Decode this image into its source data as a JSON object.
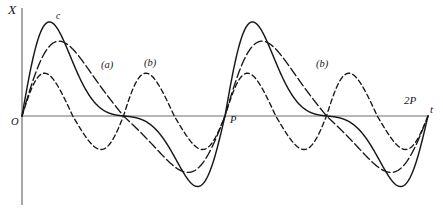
{
  "figure": {
    "kind": "line-plot",
    "background_color": "#ffffff",
    "axis_color": "#6e6e72",
    "curve_color": "#17171a"
  },
  "axes": {
    "y_axis_label": "X",
    "x_axis_label": "t",
    "origin_label": "O",
    "x_tick_labels": [
      "P",
      "2P"
    ],
    "y_axis_x_px": 22,
    "baseline_y_px": 116,
    "y_axis_top_px": 8,
    "y_axis_bottom_px": 205,
    "x_axis_left_px": 22,
    "x_axis_right_px": 428
  },
  "annotations": [
    {
      "id": "peak-c",
      "text": "c",
      "x_px": 56,
      "y_px": 12
    },
    {
      "id": "curve-a",
      "text": "(a)",
      "x_px": 101,
      "y_px": 60
    },
    {
      "id": "curve-b-1",
      "text": "(b)",
      "x_px": 144,
      "y_px": 58
    },
    {
      "id": "curve-b-2",
      "text": "(b)",
      "x_px": 316,
      "y_px": 59
    }
  ],
  "chart_data": {
    "type": "line",
    "title": "",
    "subtitle": "",
    "xlabel": "t",
    "ylabel": "X",
    "grid": false,
    "legend": "none",
    "xlim": [
      0,
      2
    ],
    "ylim": [
      -1.05,
      1.05
    ],
    "x_tick_values": [
      1,
      2
    ],
    "x_tick_labels": [
      "P",
      "2P"
    ],
    "y_tick_values": [],
    "y_tick_labels": [],
    "series": [
      {
        "name": "solid",
        "label": "c",
        "style": "solid",
        "amplitude_positive": 0.88,
        "amplitude_negative": -0.8,
        "cycles_per_period": 1,
        "skew": 0.62,
        "peak_x_px": 62,
        "peak_y_px": 28,
        "trough_x_px": 190,
        "trough_y_px": 195,
        "stroke_width": 1.45,
        "points_per_period": 1
      },
      {
        "name": "dash-dot",
        "label": "(a)",
        "style": "dash-dot",
        "amplitude_positive": 0.7,
        "amplitude_negative": -0.64,
        "cycles_per_period": 1,
        "skew": 0.3,
        "peak_x_px": 90,
        "peak_y_px": 45,
        "trough_x_px": 205,
        "trough_y_px": 180,
        "stroke_width": 1.35,
        "points_per_period": 1
      },
      {
        "name": "dashed",
        "label": "(b)",
        "style": "dashed",
        "amplitude_positive": 0.4,
        "amplitude_negative": -0.38,
        "cycles_per_period": 2,
        "skew": 0.12,
        "peak_x_px": 48,
        "peak_y_px": 75,
        "trough_x_px": 110,
        "trough_y_px": 150,
        "stroke_width": 1.35,
        "points_per_period": 2
      }
    ]
  }
}
